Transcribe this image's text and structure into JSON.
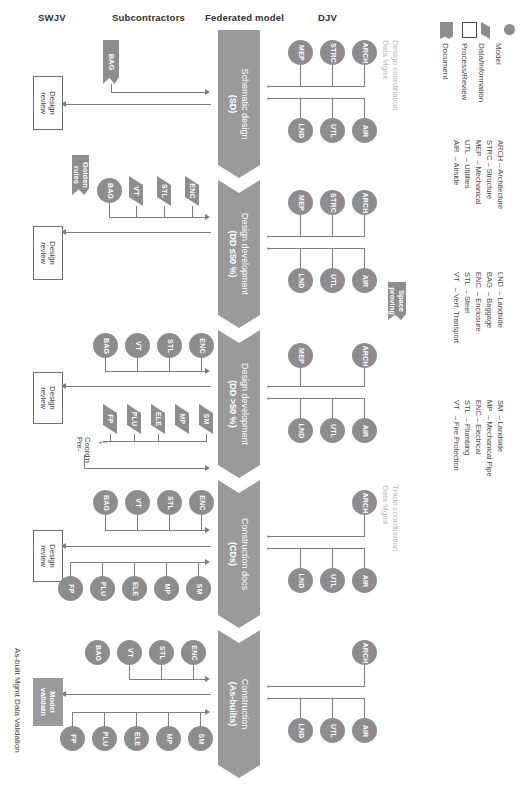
{
  "diagram": {
    "columns": [
      {
        "id": "swjv",
        "label": "SWJV"
      },
      {
        "id": "subcontractors",
        "label": "Subcontractors"
      },
      {
        "id": "federated",
        "label": "Federated model"
      },
      {
        "id": "djv",
        "label": "DJV"
      }
    ],
    "phases": [
      {
        "id": "sd",
        "name": "Schematic design",
        "code": "(SD)"
      },
      {
        "id": "dd50",
        "name": "Design development",
        "code": "(DD ≤50 %)"
      },
      {
        "id": "dd50p",
        "name": "Design development",
        "code": "(DD >50 %)"
      },
      {
        "id": "cds",
        "name": "Construction docs",
        "code": "(CDs)"
      },
      {
        "id": "asb",
        "name": "Construction",
        "code": "(As-builts)"
      }
    ],
    "side_captions": [
      {
        "id": "design-coordination",
        "text": "Design coordination\nData Mgmt"
      },
      {
        "id": "trade-coordination",
        "text": "Trade coordination\nData Mgmt"
      },
      {
        "id": "as-built-mgmt",
        "text": "As-built Mgmt Data Validation"
      }
    ],
    "review_boxes": [
      {
        "id": "review-1",
        "text": "Design\nreview"
      },
      {
        "id": "review-2",
        "text": "Design\nreview"
      },
      {
        "id": "review-3",
        "text": "Design\nreview"
      },
      {
        "id": "review-4",
        "text": "Design\nreview"
      },
      {
        "id": "model-validation",
        "text": "Model\nvalidatn"
      }
    ],
    "documents": [
      {
        "id": "golden-rules",
        "text": "Golden\nrules"
      },
      {
        "id": "space-proving",
        "text": "Space\nproving"
      }
    ],
    "annotations": [
      {
        "id": "pre-coordination",
        "text": "Pre-\nCoord'n"
      }
    ],
    "djv_rows": [
      {
        "phase": "sd",
        "top": [
          "MEP",
          "STRC",
          "ARCH"
        ],
        "bottom": [
          "LND",
          "UTL",
          "AIR"
        ]
      },
      {
        "phase": "dd50",
        "top": [
          "MEP",
          "STRC",
          "ARCH"
        ],
        "bottom": [
          "LND",
          "UTL",
          "AIR"
        ]
      },
      {
        "phase": "dd50p",
        "top": [
          "MEP",
          "ARCH"
        ],
        "bottom": [
          "LND",
          "UTL",
          "AIR"
        ]
      },
      {
        "phase": "cds",
        "top": [
          "ARCH"
        ],
        "bottom": [
          "LND",
          "UTL",
          "AIR"
        ]
      },
      {
        "phase": "asb",
        "top": [
          "ARCH"
        ],
        "bottom": [
          "LND",
          "UTL",
          "AIR"
        ]
      }
    ],
    "sub_rows": [
      {
        "phase": "sd",
        "models": [],
        "data": [
          "BAG"
        ],
        "models2": [],
        "data2": []
      },
      {
        "phase": "dd50",
        "models": [
          "BAG"
        ],
        "data": [
          "VT",
          "STL",
          "ENC"
        ],
        "models2": [],
        "data2": []
      },
      {
        "phase": "dd50p",
        "models": [
          "BAG",
          "VT",
          "STL",
          "ENC"
        ],
        "data": [],
        "models2": [],
        "data2": [
          "FP",
          "PLU",
          "ELE",
          "MP",
          "SM"
        ]
      },
      {
        "phase": "cds",
        "models": [
          "BAG",
          "VT",
          "STL",
          "ENC"
        ],
        "data": [],
        "models2": [
          "FP",
          "PLU",
          "ELE",
          "MP",
          "SM"
        ],
        "data2": []
      },
      {
        "phase": "asb",
        "models": [
          "BAG",
          "VT",
          "STL",
          "ENC"
        ],
        "data": [],
        "models2": [
          "FP",
          "PLU",
          "ELE",
          "MP",
          "SM"
        ],
        "data2": []
      }
    ]
  },
  "legend": {
    "shapes": [
      {
        "id": "model",
        "icon": "circle-icon",
        "label": "Model"
      },
      {
        "id": "data",
        "icon": "parallelogram-icon",
        "label": "Data/Information"
      },
      {
        "id": "process",
        "icon": "rectangle-icon",
        "label": "Process/Review"
      },
      {
        "id": "document",
        "icon": "document-icon",
        "label": "Document"
      }
    ],
    "abbreviations_djv": [
      {
        "code": "ARCH",
        "text": "– Architecture"
      },
      {
        "code": "STRC",
        "text": "– Structure"
      },
      {
        "code": "MEP",
        "text": "– Mechanical"
      },
      {
        "code": "UTL",
        "text": "– Utilities"
      },
      {
        "code": "AIR",
        "text": "– Airside"
      }
    ],
    "abbreviations_sub1": [
      {
        "code": "LND",
        "text": "– Landside"
      },
      {
        "code": "BAG",
        "text": "– Baggage"
      },
      {
        "code": "ENC",
        "text": "– Enclosure"
      },
      {
        "code": "STL",
        "text": "– Steel"
      },
      {
        "code": "VT",
        "text": "– Vert. Transport"
      }
    ],
    "abbreviations_sub2": [
      {
        "code": "SM",
        "text": "– Landside"
      },
      {
        "code": "MP",
        "text": "– Mechanical Pipe"
      },
      {
        "code": "ENC",
        "text": "– Electrical"
      },
      {
        "code": "STL",
        "text": "– Plumbing"
      },
      {
        "code": "VT",
        "text": "– Fire Protection"
      }
    ]
  },
  "colors": {
    "node_fill": "#8d8d8d",
    "phase_fill": "#9a9a9a",
    "line": "#7d7d7d",
    "caption_muted": "#b8b8b8",
    "text": "#3c3c3c"
  }
}
